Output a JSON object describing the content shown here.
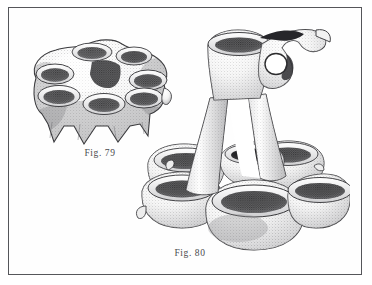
{
  "plate": {
    "background_color": "#ffffff",
    "frame_color": "#55565a",
    "ink_color": "#2b2b2d",
    "caption_color": "#4a4a4d"
  },
  "figures": [
    {
      "id": "fig-79",
      "caption": "Fig. 79",
      "subject": "multi-cup pottery vessel (kernos) with five cups on a footed ring base",
      "cup_count": 5,
      "foot_count": 4,
      "view": "three-quarter elevated",
      "technique": "stipple engraving"
    },
    {
      "id": "fig-80",
      "caption": "Fig. 80",
      "subject": "kernos with tall arched handle, looped ring and upright spouted cup above a cluster of bowls",
      "cup_count": 6,
      "has_ring_loop": true,
      "view": "three-quarter elevated",
      "technique": "stipple engraving"
    }
  ],
  "icons": {
    "fig79": "pottery-vessel-icon",
    "fig80": "pottery-vessel-handle-icon"
  }
}
